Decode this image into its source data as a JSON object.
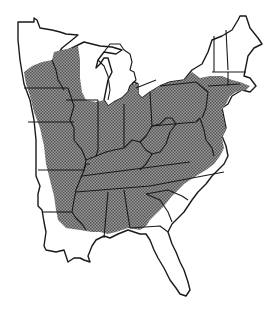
{
  "map": {
    "title": "",
    "region": "Eastern United States",
    "description": "Range map showing hatched distribution area across eastern US states",
    "colors": {
      "background": "#ffffff",
      "outline": "#1a1a1a",
      "range_fill": "#8a8a8a",
      "range_dot": "#5a5a5a",
      "range_light": "#b8b8b8"
    },
    "legend": [],
    "labels": []
  }
}
